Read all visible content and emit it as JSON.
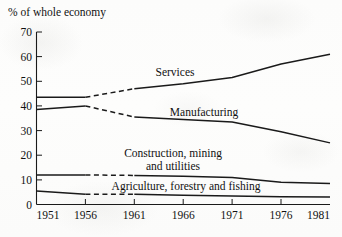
{
  "chart_data": {
    "type": "line",
    "title": "",
    "ylabel": "% of whole economy",
    "xlabel": "",
    "xlim": [
      1951,
      1981
    ],
    "ylim": [
      0,
      70
    ],
    "grid": false,
    "legend_position": "inline-labels",
    "x": [
      1951,
      1956,
      1961,
      1966,
      1971,
      1976,
      1981
    ],
    "xticks": [
      "1951",
      "1956",
      "1961",
      "1966",
      "1971",
      "1976",
      "1981"
    ],
    "yticks": [
      "0",
      "10",
      "20",
      "30",
      "40",
      "50",
      "60",
      "70"
    ],
    "series": [
      {
        "name": "Services",
        "label": "Services",
        "values": [
          43.5,
          43.5,
          47.0,
          49.0,
          51.5,
          57.0,
          61.0
        ],
        "dashed_segment": [
          1956,
          1961
        ],
        "label_x": 1963.4,
        "label_y": 52.5
      },
      {
        "name": "Manufacturing",
        "label": "Manufacturing",
        "values": [
          38.5,
          40.0,
          35.5,
          34.5,
          33.5,
          29.5,
          25.0
        ],
        "dashed_segment": [
          1956,
          1961
        ],
        "label_x": 1964.0,
        "label_y": 38.0
      },
      {
        "name": "Construction, mining and utilities",
        "label_line1": "Construction, mining",
        "label_line2": "and utilities",
        "values": [
          12.0,
          12.0,
          11.8,
          11.5,
          11.0,
          9.0,
          8.5
        ],
        "dashed_segment": [
          1956,
          1961
        ],
        "label_x": 1963.5,
        "label_y": 21.5
      },
      {
        "name": "Agriculture, forestry and fishing",
        "label": "Agriculture, forestry and fishing",
        "values": [
          5.5,
          4.2,
          4.2,
          3.8,
          3.4,
          3.1,
          3.0
        ],
        "dashed_segment": [
          1956,
          1961
        ],
        "label_x": 1963.0,
        "label_y": 8.0
      }
    ],
    "colors": {
      "line": "#1a1a1a",
      "axis": "#1a1a1a",
      "background": "#fdfdfc"
    }
  }
}
